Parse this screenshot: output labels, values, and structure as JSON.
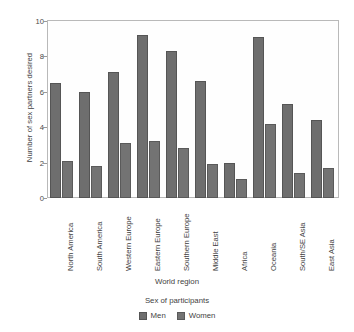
{
  "chart_data": {
    "type": "bar",
    "title": "",
    "xlabel": "World region",
    "ylabel": "Number of sex partners desired",
    "ylim": [
      0,
      10
    ],
    "yticks": [
      0,
      2,
      4,
      6,
      8,
      10
    ],
    "grid": false,
    "legend_title": "Sex of participants",
    "legend_position": "bottom-center",
    "categories": [
      "North America",
      "South America",
      "Western Europe",
      "Eastern Europe",
      "Southern Europe",
      "Middle East",
      "Africa",
      "Oceania",
      "South/SE Asia",
      "East Asia"
    ],
    "series": [
      {
        "name": "Men",
        "color": "#6e6e6e",
        "values": [
          6.5,
          6.0,
          7.1,
          9.2,
          8.3,
          6.6,
          2.0,
          9.1,
          5.3,
          4.4
        ]
      },
      {
        "name": "Women",
        "color": "#737373",
        "values": [
          2.1,
          1.8,
          3.1,
          3.2,
          2.8,
          1.9,
          1.1,
          4.2,
          1.4,
          1.7
        ]
      }
    ]
  }
}
